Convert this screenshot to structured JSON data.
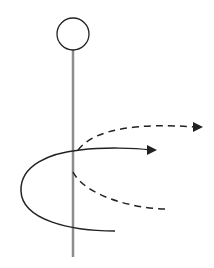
{
  "diagram": {
    "title": "",
    "colors": {
      "background": "#ffffff",
      "pole": "#8c8c8c",
      "stroke": "#222222",
      "head_fill": "#ffffff"
    },
    "elements": {
      "head": {
        "shape": "circle",
        "cx": 73,
        "cy": 34,
        "r": 16
      },
      "pole": {
        "shape": "line",
        "x1": 73,
        "y1": 50,
        "x2": 73,
        "y2": 257
      },
      "solid_path": {
        "style": "solid",
        "d": "M 115 231 C 70 231, 22 220, 21 191 C 20 165, 50 153, 80 150 C 105 147, 135 148, 151 150",
        "arrow_head": "147,145 157,150 147,155"
      },
      "dashed_path": {
        "style": "dashed",
        "d": "M 165 209 C 130 208, 85 195, 73 172 M 78 150 C 95 128, 140 123, 196 127",
        "arrow_head": "193,122 203,127 193,132"
      }
    }
  }
}
